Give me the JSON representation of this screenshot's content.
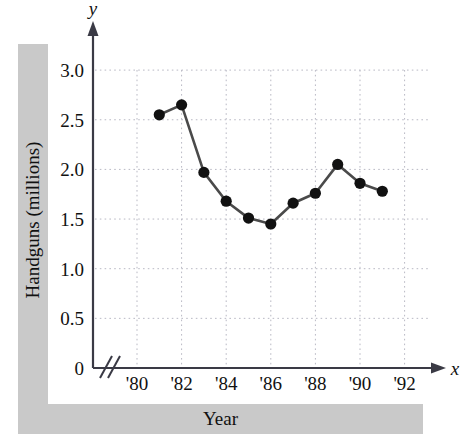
{
  "labels": {
    "y_band": "Handguns (millions)",
    "x_band": "Year",
    "x_axis_name": "x",
    "y_axis_name": "y"
  },
  "colors": {
    "band": "#c9c9c9",
    "axis": "#3a3a45",
    "grid": "#b9b9c4",
    "series": "#4a4a4a",
    "marker": "#111111",
    "text": "#111111"
  },
  "chart_data": {
    "type": "line",
    "title": "",
    "xlabel": "Year",
    "ylabel": "Handguns (millions)",
    "xlim": [
      1979.5,
      1992.8
    ],
    "ylim": [
      0,
      3.25
    ],
    "grid": true,
    "legend": null,
    "axis_break_x": true,
    "y_ticks": [
      0,
      0.5,
      1.0,
      1.5,
      2.0,
      2.5,
      3.0
    ],
    "y_tick_labels": [
      "0",
      "0.5",
      "1.0",
      "1.5",
      "2.0",
      "2.5",
      "3.0"
    ],
    "x_ticks": [
      1980,
      1982,
      1984,
      1986,
      1988,
      1990,
      1992
    ],
    "x_tick_labels": [
      "'80",
      "'82",
      "'84",
      "'86",
      "'88",
      "'90",
      "'92"
    ],
    "x": [
      1981,
      1982,
      1983,
      1984,
      1985,
      1986,
      1987,
      1988,
      1989,
      1990,
      1991
    ],
    "values": [
      2.55,
      2.65,
      1.97,
      1.68,
      1.51,
      1.45,
      1.66,
      1.76,
      2.05,
      1.86,
      1.78
    ]
  }
}
